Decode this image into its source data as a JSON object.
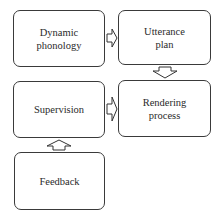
{
  "diagram": {
    "nodes": [
      {
        "id": "dynamic_phonology",
        "label": "Dynamic\nphonology"
      },
      {
        "id": "utterance_plan",
        "label": "Utterance\nplan"
      },
      {
        "id": "supervision",
        "label": "Supervision"
      },
      {
        "id": "rendering_process",
        "label": "Rendering\nprocess"
      },
      {
        "id": "feedback",
        "label": "Feedback"
      }
    ],
    "edges": [
      {
        "from": "dynamic_phonology",
        "to": "utterance_plan",
        "direction": "right"
      },
      {
        "from": "utterance_plan",
        "to": "rendering_process",
        "direction": "down"
      },
      {
        "from": "supervision",
        "to": "rendering_process",
        "direction": "right"
      },
      {
        "from": "feedback",
        "to": "supervision",
        "direction": "up"
      }
    ],
    "colors": {
      "border": "#3a3a3a",
      "text": "#2a2a2a",
      "background": "#ffffff"
    }
  }
}
